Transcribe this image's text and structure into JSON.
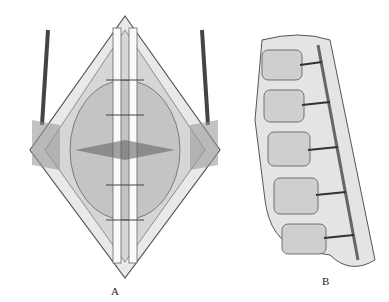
{
  "figure": {
    "top_text_fragment": "",
    "panels": [
      {
        "label": "A",
        "description": "Posterior surgical view of spine with retracted tissues and rod fixation"
      },
      {
        "label": "B",
        "description": "Lateral view of lumbar vertebrae with screw fixation"
      }
    ]
  }
}
